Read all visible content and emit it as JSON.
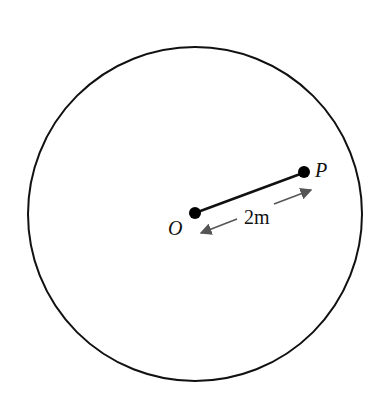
{
  "diagram": {
    "type": "circle-with-radius-segment",
    "circle": {
      "cx": 195,
      "cy": 214,
      "r": 167,
      "stroke": "#111111"
    },
    "points": [
      {
        "label": "O",
        "x": 195,
        "y": 213
      },
      {
        "label": "P",
        "x": 303,
        "y": 173
      }
    ],
    "segment": {
      "from": "O",
      "to": "P"
    },
    "dimension": {
      "label": "2 m",
      "arrow_color": "#555555"
    }
  },
  "labels": {
    "point_o": "O",
    "point_p": "P",
    "distance": "2m"
  }
}
